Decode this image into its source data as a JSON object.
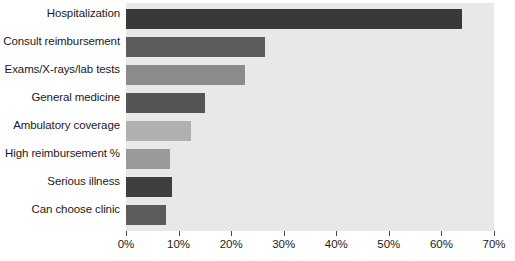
{
  "chart_data": {
    "type": "bar",
    "orientation": "horizontal",
    "title": "",
    "subtitle": "",
    "xlabel": "",
    "ylabel": "",
    "xlim": [
      0,
      70
    ],
    "grid": false,
    "legend": false,
    "categories": [
      "Hospitalization",
      "Consult reimbursement",
      "Exams/X-rays/lab tests",
      "General medicine",
      "Ambulatory coverage",
      "High reimbursement %",
      "Serious illness",
      "Can choose clinic"
    ],
    "values": [
      64,
      26.4,
      22.6,
      15.0,
      12.4,
      8.4,
      8.8,
      7.6
    ],
    "value_labels": [
      "64%",
      "26.4%",
      "22.6%",
      "15%",
      "12.4%",
      "8.4%",
      "8.8%",
      "7.6%"
    ],
    "bar_colors": [
      "#393939",
      "#5d5d5d",
      "#8b8b8b",
      "#555555",
      "#b0b0b0",
      "#9a9a9a",
      "#3f3f3f",
      "#5c5c5c"
    ],
    "xticks": [
      0,
      10,
      20,
      30,
      40,
      50,
      60,
      70
    ],
    "xtick_labels": [
      "0%",
      "10%",
      "20%",
      "30%",
      "40%",
      "50%",
      "60%",
      "70%"
    ],
    "plot_background": "#e8e8e6",
    "figure_background": "#ffffff",
    "axis_color": "#4a4a4a",
    "text_color": "#1b1b1b"
  }
}
